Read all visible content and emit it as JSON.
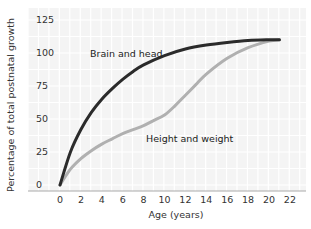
{
  "chart_data": {
    "type": "line",
    "title": "",
    "xlabel": "Age (years)",
    "ylabel": "Percentage of total postnatal growth",
    "xlim": [
      -2,
      23
    ],
    "ylim": [
      0,
      130
    ],
    "xticks": [
      0,
      2,
      4,
      6,
      8,
      10,
      12,
      14,
      16,
      18,
      20,
      22
    ],
    "yticks": [
      0,
      25,
      50,
      75,
      100,
      125
    ],
    "grid": true,
    "legend": "inline labels",
    "series": [
      {
        "name": "Brain and head",
        "color": "#2b2b2b",
        "x": [
          0,
          1,
          2,
          3,
          4,
          5,
          6,
          7,
          8,
          10,
          12,
          14,
          16,
          18,
          20,
          21
        ],
        "values": [
          0,
          25,
          42,
          55,
          65,
          73,
          80,
          86,
          91,
          98,
          103,
          106,
          108,
          109.5,
          110,
          110
        ]
      },
      {
        "name": "Height and weight",
        "color": "#b0b0b0",
        "x": [
          0,
          1,
          2,
          3,
          4,
          5,
          6,
          7,
          8,
          9,
          10,
          11,
          12,
          13,
          14,
          16,
          18,
          20,
          21
        ],
        "values": [
          0,
          12,
          20,
          26,
          31,
          35,
          39,
          42,
          45,
          49,
          53,
          60,
          68,
          76,
          84,
          96,
          104,
          109,
          110
        ]
      }
    ],
    "annotations": [
      {
        "text": "Brain and head",
        "x": 9.5,
        "y": 103
      },
      {
        "text": "Height and weight",
        "x": 14,
        "y": 35
      }
    ]
  }
}
